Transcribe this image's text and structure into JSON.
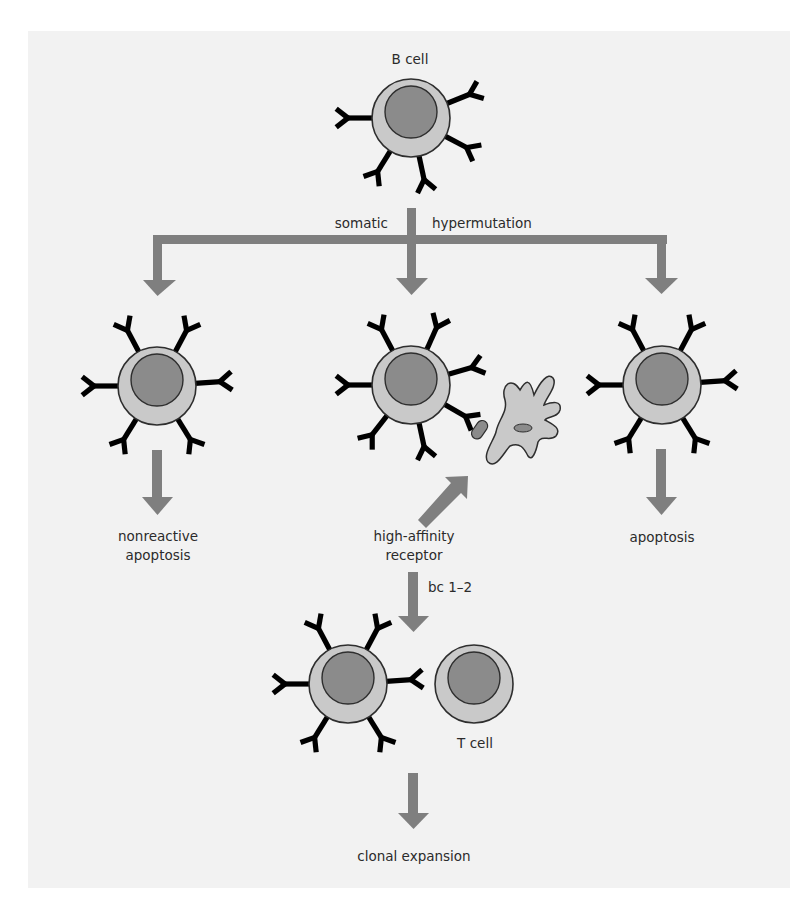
{
  "diagram": {
    "title_cell": "B cell",
    "process_label_left": "somatic",
    "process_label_right": "hypermutation",
    "branches": [
      {
        "id": "left",
        "outcome": [
          "nonreactive",
          "apoptosis"
        ]
      },
      {
        "id": "middle",
        "outcome": [
          "high-affinity",
          "receptor"
        ],
        "note": "bc 1–2"
      },
      {
        "id": "right",
        "outcome": [
          "apoptosis"
        ]
      }
    ],
    "t_cell_label": "T cell",
    "final_outcome": "clonal expansion"
  },
  "colors": {
    "background": "#f2f2f2",
    "cytoplasm": "#c9c9c9",
    "nucleus": "#8b8b8b",
    "arrow": "#7f7f7f",
    "outline": "#2e2e2e",
    "text": "#2b2b2b"
  }
}
